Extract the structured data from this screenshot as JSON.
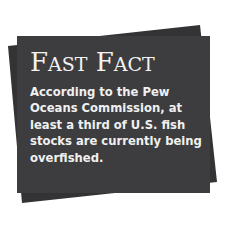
{
  "callout": {
    "title_first_initial": "F",
    "title_first_rest": "AST",
    "title_second_initial": "F",
    "title_second_rest": "ACT",
    "title": "Fast Fact",
    "lines": [
      "According to the Pew",
      "Oceans Commission, at",
      "least a third of U.S. fish",
      "stocks are currently being",
      "overfished."
    ],
    "text": "According to the Pew Oceans Commission, at least a third of U.S. fish stocks are currently being overfished."
  },
  "colors": {
    "card": "#3d3d3f",
    "card_back": "#333335",
    "text": "#f4f4f4",
    "background": "#ffffff"
  }
}
